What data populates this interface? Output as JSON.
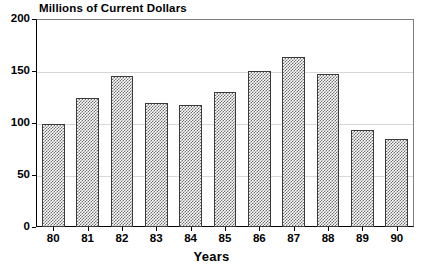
{
  "chart_data": {
    "type": "bar",
    "title": "Millions of Current Dollars",
    "xlabel": "Years",
    "ylabel": "",
    "categories": [
      "80",
      "81",
      "82",
      "83",
      "84",
      "85",
      "86",
      "87",
      "88",
      "89",
      "90"
    ],
    "values": [
      99,
      124,
      145,
      119,
      117,
      130,
      150,
      163,
      147,
      93,
      85
    ],
    "ylim": [
      0,
      200
    ],
    "yticks": [
      0,
      50,
      100,
      150,
      200
    ],
    "ytick_labels": [
      "0",
      "50",
      "100",
      "150",
      "200"
    ],
    "grid": true,
    "legend": "none",
    "bar_fill": "checkerboard-hatch",
    "bar_edge_color": "#3a3a3a",
    "grid_color": "#d8d8d8",
    "axis_color": "#000000",
    "background": "#ffffff"
  }
}
